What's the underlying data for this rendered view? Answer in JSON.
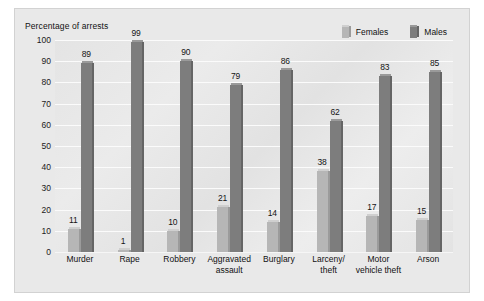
{
  "chart_data": {
    "type": "bar",
    "title": "Percentage of arrests",
    "xlabel": "",
    "ylabel": "",
    "ylim": [
      0,
      100
    ],
    "yticks": [
      100,
      90,
      80,
      70,
      60,
      50,
      40,
      30,
      20,
      10,
      0
    ],
    "grid": true,
    "legend_position": "top-right",
    "categories": [
      "Murder",
      "Rape",
      "Robbery",
      "Aggravated assault",
      "Burglary",
      "Larceny/ theft",
      "Motor vehicle theft",
      "Arson"
    ],
    "category_lines": [
      [
        "Murder"
      ],
      [
        "Rape"
      ],
      [
        "Robbery"
      ],
      [
        "Aggravated",
        "assault"
      ],
      [
        "Burglary"
      ],
      [
        "Larceny/",
        "theft"
      ],
      [
        "Motor",
        "vehicle theft"
      ],
      [
        "Arson"
      ]
    ],
    "series": [
      {
        "name": "Females",
        "color": "#b6b6b6",
        "values": [
          11,
          1,
          10,
          21,
          14,
          38,
          17,
          15
        ]
      },
      {
        "name": "Males",
        "color": "#7d7d7d",
        "values": [
          89,
          99,
          90,
          79,
          86,
          62,
          83,
          85
        ]
      }
    ]
  },
  "colors": {
    "panel_background": "#e9e9e9",
    "plot_background": "#e6e6e6",
    "gridline": "#fbfbfb",
    "text": "#111111",
    "females_bar": "#b6b6b6",
    "females_bar_top": "#cfcfcf",
    "females_bar_side": "#9b9b9b",
    "males_bar": "#7d7d7d",
    "males_bar_top": "#9a9a9a",
    "males_bar_side": "#656565"
  }
}
